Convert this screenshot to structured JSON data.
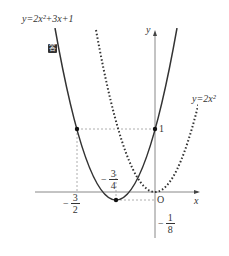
{
  "labels": {
    "quadratic_eq": "y=2x²+3x+1",
    "parabola_eq": "y=2x²",
    "y_axis": "y",
    "x_axis": "x",
    "origin": "O",
    "y_intercept": "1",
    "answer_badge": "答"
  },
  "fractions": {
    "neg_three_halves": {
      "sign": "−",
      "num": "3",
      "den": "2"
    },
    "neg_three_quarters": {
      "sign": "−",
      "num": "3",
      "den": "4"
    },
    "neg_one_eighth": {
      "sign": "−",
      "num": "1",
      "den": "8"
    }
  },
  "points": [
    {
      "name": "point-neg3/2-1",
      "x": -1.5,
      "y": 1
    },
    {
      "name": "point-0-1",
      "x": 0,
      "y": 1
    },
    {
      "name": "vertex",
      "x": -0.75,
      "y": -0.125
    }
  ],
  "colors": {
    "curve": "#333333",
    "axis": "#888888",
    "guide": "#999999"
  }
}
